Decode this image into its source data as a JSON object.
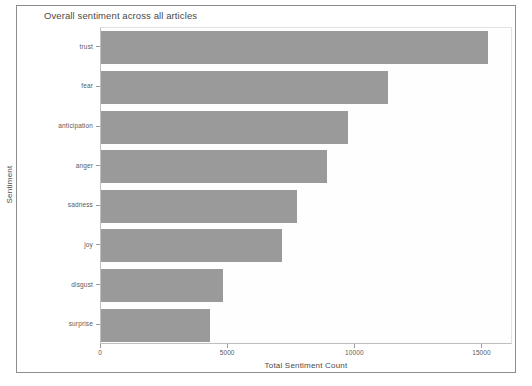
{
  "figure": {
    "background_color": "#ffffff",
    "frame_color": "#8d8d8d",
    "bar_color": "#9a9a9a",
    "axis_color": "#9b9b9b"
  },
  "chart_data": {
    "type": "bar",
    "orientation": "horizontal",
    "title": "Overall sentiment across all articles",
    "xlabel": "Total Sentiment Count",
    "ylabel": "Sentiment",
    "categories": [
      "trust",
      "fear",
      "anticipation",
      "anger",
      "sadness",
      "joy",
      "disgust",
      "surprise"
    ],
    "values": [
      15200,
      11300,
      9700,
      8900,
      7700,
      7100,
      4800,
      4300
    ],
    "xticks": [
      0,
      5000,
      10000,
      15000
    ],
    "xtick_labels": [
      "0",
      "5000",
      "10000",
      "15000"
    ],
    "xlim": [
      0,
      16200
    ],
    "grid": false,
    "legend": null,
    "series_color": "#9a9a9a"
  }
}
